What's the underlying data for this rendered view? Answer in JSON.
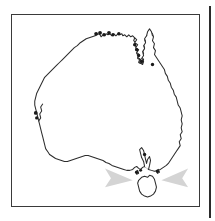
{
  "figure": {
    "panel_label": "",
    "caption": "",
    "background_color": "#ffffff",
    "border_color": "#3a3a3a",
    "map_region_name": "Australia"
  },
  "map": {
    "outline_name": "australia-mainland-outline",
    "outline_stroke_color": "#2c2c2c",
    "outline_fill_color": "#ffffff",
    "islands": [
      {
        "name": "tasmania",
        "label": ""
      }
    ]
  },
  "markers": {
    "symbol": "filled-circle",
    "color": "#1a1a1a",
    "count": 17,
    "points": [
      {
        "name": "sampling-site-nw-kimberley-1",
        "x": 96,
        "y": 33
      },
      {
        "name": "sampling-site-nw-kimberley-2",
        "x": 100,
        "y": 32
      },
      {
        "name": "sampling-site-nw-kimberley-3",
        "x": 104,
        "y": 35
      },
      {
        "name": "sampling-site-darwin-1",
        "x": 109,
        "y": 33
      },
      {
        "name": "sampling-site-darwin-2",
        "x": 113,
        "y": 35
      },
      {
        "name": "sampling-site-arnhem-1",
        "x": 119,
        "y": 36
      },
      {
        "name": "sampling-site-gulf-1",
        "x": 127,
        "y": 45
      },
      {
        "name": "sampling-site-gulf-2",
        "x": 129,
        "y": 48
      },
      {
        "name": "sampling-site-gulf-3",
        "x": 131,
        "y": 52
      },
      {
        "name": "sampling-site-cape-york-1",
        "x": 139,
        "y": 57
      },
      {
        "name": "sampling-site-cape-york-2",
        "x": 142,
        "y": 60
      },
      {
        "name": "sampling-site-perth-1",
        "x": 31,
        "y": 111
      },
      {
        "name": "sampling-site-perth-2",
        "x": 32,
        "y": 115
      },
      {
        "name": "sampling-site-adelaide",
        "x": 129,
        "y": 148
      },
      {
        "name": "sampling-site-bass-strait-1",
        "x": 144,
        "y": 170
      },
      {
        "name": "sampling-site-bass-strait-2",
        "x": 146,
        "y": 171
      },
      {
        "name": "sampling-site-bass-strait-3",
        "x": 158,
        "y": 171
      }
    ]
  },
  "annotations": {
    "arrow_color": "#d4d4d4",
    "arrows": [
      {
        "name": "left-pointer-arrow",
        "direction": "right",
        "target": "tasmania"
      },
      {
        "name": "right-pointer-arrow",
        "direction": "left",
        "target": "tasmania"
      }
    ]
  }
}
